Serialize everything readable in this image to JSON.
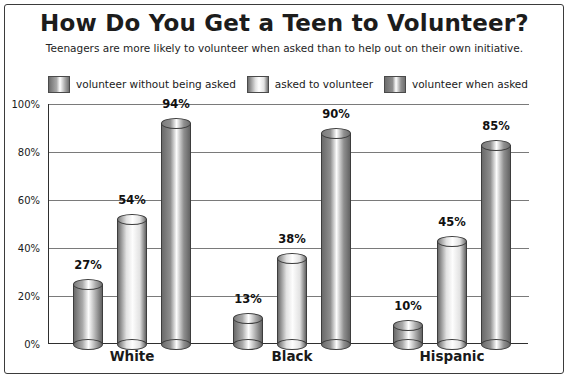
{
  "chart_data": {
    "type": "bar",
    "title": "How Do You Get a Teen to Volunteer?",
    "subtitle": "Teenagers are more likely to volunteer when asked than to help out on their own initiative.",
    "categories": [
      "White",
      "Black",
      "Hispanic"
    ],
    "series": [
      {
        "name": "volunteer without being asked",
        "values": [
          27,
          13,
          10
        ],
        "labels": [
          "27%",
          "13%",
          "10%"
        ],
        "color": "#a9a9a9"
      },
      {
        "name": "asked to volunteer",
        "values": [
          54,
          38,
          45
        ],
        "labels": [
          "54%",
          "38%",
          "45%"
        ],
        "color": "#e2e2e2"
      },
      {
        "name": "volunteer when asked",
        "values": [
          94,
          90,
          85
        ],
        "labels": [
          "94%",
          "90%",
          "85%"
        ],
        "color": "#8f8f8f"
      }
    ],
    "xlabel": "",
    "ylabel": "",
    "ylim": [
      0,
      100
    ],
    "yticks": [
      "0%",
      "20%",
      "40%",
      "60%",
      "80%",
      "100%"
    ],
    "grid": true,
    "legend_position": "top"
  },
  "legend": {
    "items": [
      {
        "label": "volunteer without being asked"
      },
      {
        "label": "asked to volunteer"
      },
      {
        "label": "volunteer when asked"
      }
    ]
  },
  "axis": {
    "yticks": [
      "100%",
      "80%",
      "60%",
      "40%",
      "20%",
      "0%"
    ]
  }
}
